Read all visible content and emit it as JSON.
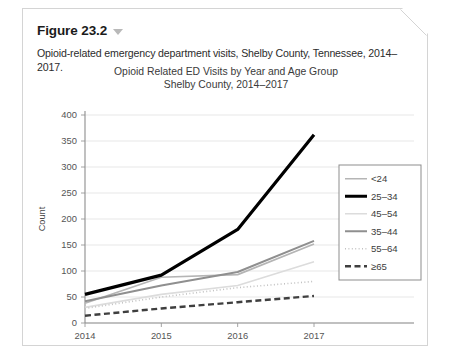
{
  "figure": {
    "label": "Figure 23.2",
    "caret_icon": "chevron-down-icon",
    "caption": "Opioid-related emergency department visits, Shelby County, Tennessee, 2014–2017."
  },
  "chart_data": {
    "type": "line",
    "title_line1": "Opioid Related ED Visits by Year and Age Group",
    "title_line2": "Shelby County, 2014–2017",
    "xlabel": "",
    "ylabel": "Count",
    "categories": [
      "2014",
      "2015",
      "2016",
      "2017"
    ],
    "x": [
      2014,
      2015,
      2016,
      2017
    ],
    "ylim": [
      0,
      400
    ],
    "yticks": [
      0,
      50,
      100,
      150,
      200,
      250,
      300,
      350,
      400
    ],
    "grid": true,
    "legend_position": "right",
    "series": [
      {
        "name": "<24",
        "values": [
          38,
          88,
          93,
          152
        ],
        "color": "#b5b5b5",
        "width": 1.7,
        "dash": "none"
      },
      {
        "name": "25–34",
        "values": [
          55,
          92,
          180,
          362
        ],
        "color": "#000000",
        "width": 3.2,
        "dash": "none"
      },
      {
        "name": "45–54",
        "values": [
          30,
          55,
          72,
          118
        ],
        "color": "#dcdcdc",
        "width": 1.6,
        "dash": "none"
      },
      {
        "name": "35–44",
        "values": [
          42,
          72,
          98,
          158
        ],
        "color": "#8f8f8f",
        "width": 2.0,
        "dash": "none"
      },
      {
        "name": "55–64",
        "values": [
          28,
          50,
          68,
          80
        ],
        "color": "#c2c2c2",
        "width": 1.6,
        "dash": "1,2.4"
      },
      {
        "name": "≥65",
        "values": [
          14,
          28,
          40,
          52
        ],
        "color": "#3f3f3f",
        "width": 2.4,
        "dash": "6,3.5"
      }
    ]
  }
}
